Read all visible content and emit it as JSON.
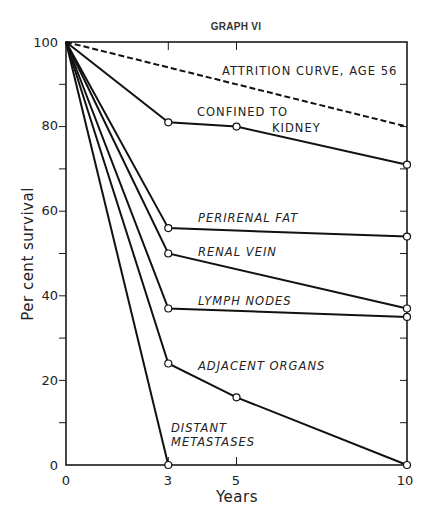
{
  "chart_data": {
    "type": "line",
    "title": "GRAPH VI",
    "xlabel": "Years",
    "ylabel": "Per cent survival",
    "xlim": [
      0,
      10
    ],
    "ylim": [
      0,
      100
    ],
    "x_ticks": [
      0,
      3,
      5,
      10
    ],
    "y_ticks": [
      0,
      20,
      40,
      60,
      80,
      100
    ],
    "y_minor_ticks": [
      10,
      30,
      50,
      70,
      90
    ],
    "grid": false,
    "legend": "inline labels",
    "series": [
      {
        "name": "ATTRITION CURVE, AGE 56",
        "style": "dashed",
        "x": [
          0,
          10
        ],
        "values": [
          100,
          80
        ],
        "markers": false
      },
      {
        "name": "CONFINED TO KIDNEY",
        "style": "solid",
        "x": [
          0,
          3,
          5,
          10
        ],
        "values": [
          100,
          81,
          80,
          71
        ],
        "markers": true
      },
      {
        "name": "PERIRENAL FAT",
        "style": "solid",
        "x": [
          0,
          3,
          10
        ],
        "values": [
          100,
          56,
          54
        ],
        "markers": true
      },
      {
        "name": "RENAL VEIN",
        "style": "solid",
        "x": [
          0,
          3,
          10
        ],
        "values": [
          100,
          50,
          37
        ],
        "markers": true
      },
      {
        "name": "LYMPH NODES",
        "style": "solid",
        "x": [
          0,
          3,
          10
        ],
        "values": [
          100,
          37,
          35
        ],
        "markers": true
      },
      {
        "name": "ADJACENT ORGANS",
        "style": "solid",
        "x": [
          0,
          3,
          5,
          10
        ],
        "values": [
          100,
          24,
          16,
          0
        ],
        "markers": true
      },
      {
        "name": "DISTANT METASTASES",
        "style": "solid",
        "x": [
          0,
          3
        ],
        "values": [
          100,
          0
        ],
        "markers": true
      }
    ]
  },
  "labels": {
    "title": "GRAPH VI",
    "xlabel": "Years",
    "ylabel": "Per cent survival",
    "attrition": "ATTRITION CURVE, AGE 56",
    "confined_1": "CONFINED TO",
    "confined_2": "KIDNEY",
    "perirenal": "PERIRENAL FAT",
    "renal_vein": "RENAL VEIN",
    "lymph": "LYMPH NODES",
    "adjacent": "ADJACENT ORGANS",
    "distant_1": "DISTANT",
    "distant_2": "METASTASES",
    "y_tick_labels": [
      "0",
      "20",
      "40",
      "60",
      "80",
      "100"
    ],
    "x_tick_labels": [
      "0",
      "3",
      "5",
      "10"
    ]
  }
}
